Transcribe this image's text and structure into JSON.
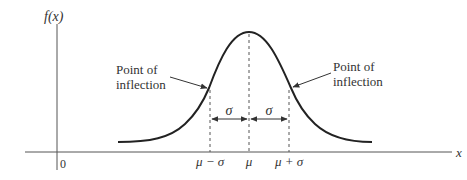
{
  "diagram": {
    "y_axis_label": "f(x)",
    "x_axis_label": "x",
    "origin_label": "0",
    "x_ticks": [
      "μ − σ",
      "μ",
      "μ + σ"
    ],
    "sigma_labels": [
      "σ",
      "σ"
    ],
    "annotations": [
      {
        "line1": "Point of",
        "line2": "inflection",
        "side": "left"
      },
      {
        "line1": "Point of",
        "line2": "inflection",
        "side": "right"
      }
    ],
    "colors": {
      "curve": "#222222",
      "axis": "#555555",
      "text": "#333333"
    }
  }
}
